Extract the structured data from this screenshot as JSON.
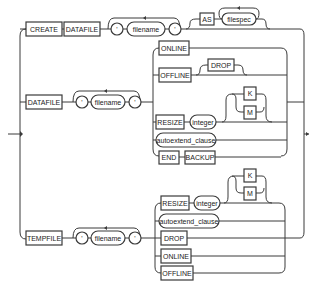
{
  "diagram": {
    "type": "railroad-syntax-diagram",
    "branches": {
      "create": {
        "keyword1": "CREATE",
        "keyword2": "DATAFILE",
        "quote_open": "'",
        "filename": "filename",
        "quote_close": "'",
        "as_keyword": "AS",
        "filespec": "filespec"
      },
      "datafile": {
        "keyword": "DATAFILE",
        "quote_open": "'",
        "filename": "filename",
        "quote_close": "'",
        "options": {
          "online": "ONLINE",
          "offline": "OFFLINE",
          "drop": "DROP",
          "resize": "RESIZE",
          "integer": "integer",
          "k": "K",
          "m": "M",
          "autoextend": "autoextend_clause",
          "end": "END",
          "backup": "BACKUP"
        }
      },
      "tempfile": {
        "keyword": "TEMPFILE",
        "quote_open": "'",
        "filename": "filename",
        "quote_close": "'",
        "options": {
          "resize": "RESIZE",
          "integer": "integer",
          "k": "K",
          "m": "M",
          "autoextend": "autoextend_clause",
          "drop": "DROP",
          "online": "ONLINE",
          "offline": "OFFLINE"
        }
      }
    }
  }
}
